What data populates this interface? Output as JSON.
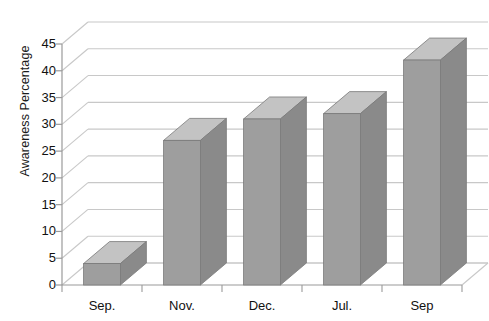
{
  "chart_data": {
    "type": "bar",
    "title": "",
    "subtitle": "",
    "xlabel": "",
    "ylabel": "Awareness Percentage",
    "categories": [
      "Sep.",
      "Nov.",
      "Dec.",
      "Jul.",
      "Sep"
    ],
    "values": [
      4,
      27,
      31,
      32,
      42
    ],
    "ylim": [
      0,
      45
    ],
    "ytick_step": 5,
    "yticks": [
      0,
      5,
      10,
      15,
      20,
      25,
      30,
      35,
      40,
      45
    ],
    "ytick_labels": [
      "0",
      "5",
      "10",
      "15",
      "20",
      "25",
      "30",
      "35",
      "40",
      "45"
    ],
    "grid": true,
    "grid_axis": "y",
    "legend": false,
    "legend_position": "none",
    "style": "3d-column",
    "series": [
      {
        "name": "Awareness Percentage",
        "values": [
          4,
          27,
          31,
          32,
          42
        ]
      }
    ],
    "annotations": [],
    "colors": {
      "bar_front": "#9e9e9e",
      "bar_top": "#c3c3c3",
      "bar_side": "#8a8a8a",
      "bar_edge": "#7a7a7a",
      "grid_line": "#c8c8c8",
      "axis_line": "#9a9a9a",
      "text": "#111111",
      "background": "#ffffff"
    }
  }
}
